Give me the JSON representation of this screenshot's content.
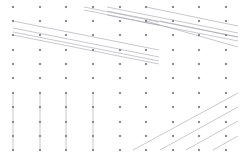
{
  "canvas": {
    "width": 241,
    "height": 160,
    "background": "#ffffff"
  },
  "style": {
    "point_color": "#8c8c99",
    "point_size": 2.1,
    "line_color": "#9b9bab",
    "line_width": 0.55
  },
  "chart_data": {
    "type": "scatter",
    "title": "",
    "subtitle": "",
    "xlabel": "",
    "ylabel": "",
    "grid": false,
    "legend": "none",
    "axis_visible": false,
    "tick_labels_x": [],
    "tick_labels_y": [],
    "xlim": [
      0,
      10
    ],
    "ylim": [
      0,
      10
    ],
    "grid_columns_px": [
      13,
      40,
      66,
      93,
      120,
      146,
      173,
      199,
      226,
      238
    ],
    "grid_rows_px": [
      7,
      21,
      35,
      50,
      64,
      78,
      93,
      107,
      122,
      136,
      150
    ],
    "points": [
      {
        "x": 13,
        "y": 7
      },
      {
        "x": 40,
        "y": 7
      },
      {
        "x": 66,
        "y": 7
      },
      {
        "x": 93,
        "y": 7
      },
      {
        "x": 120,
        "y": 7
      },
      {
        "x": 146,
        "y": 7
      },
      {
        "x": 173,
        "y": 7
      },
      {
        "x": 199,
        "y": 7
      },
      {
        "x": 226,
        "y": 7
      },
      {
        "x": 13,
        "y": 21
      },
      {
        "x": 40,
        "y": 21
      },
      {
        "x": 66,
        "y": 21
      },
      {
        "x": 93,
        "y": 21
      },
      {
        "x": 120,
        "y": 21
      },
      {
        "x": 146,
        "y": 21
      },
      {
        "x": 173,
        "y": 21
      },
      {
        "x": 199,
        "y": 21
      },
      {
        "x": 226,
        "y": 21
      },
      {
        "x": 13,
        "y": 35
      },
      {
        "x": 40,
        "y": 35
      },
      {
        "x": 66,
        "y": 35
      },
      {
        "x": 93,
        "y": 35
      },
      {
        "x": 120,
        "y": 35
      },
      {
        "x": 146,
        "y": 35
      },
      {
        "x": 173,
        "y": 35
      },
      {
        "x": 199,
        "y": 35
      },
      {
        "x": 226,
        "y": 35
      },
      {
        "x": 13,
        "y": 50
      },
      {
        "x": 40,
        "y": 50
      },
      {
        "x": 66,
        "y": 50
      },
      {
        "x": 93,
        "y": 50
      },
      {
        "x": 120,
        "y": 50
      },
      {
        "x": 146,
        "y": 50
      },
      {
        "x": 173,
        "y": 50
      },
      {
        "x": 199,
        "y": 50
      },
      {
        "x": 226,
        "y": 50
      },
      {
        "x": 13,
        "y": 64
      },
      {
        "x": 40,
        "y": 64
      },
      {
        "x": 66,
        "y": 64
      },
      {
        "x": 93,
        "y": 64
      },
      {
        "x": 120,
        "y": 64
      },
      {
        "x": 146,
        "y": 64
      },
      {
        "x": 173,
        "y": 64
      },
      {
        "x": 199,
        "y": 64
      },
      {
        "x": 226,
        "y": 64
      },
      {
        "x": 13,
        "y": 78
      },
      {
        "x": 40,
        "y": 78
      },
      {
        "x": 66,
        "y": 78
      },
      {
        "x": 93,
        "y": 78
      },
      {
        "x": 120,
        "y": 78
      },
      {
        "x": 146,
        "y": 78
      },
      {
        "x": 173,
        "y": 78
      },
      {
        "x": 199,
        "y": 78
      },
      {
        "x": 226,
        "y": 78
      },
      {
        "x": 13,
        "y": 93
      },
      {
        "x": 40,
        "y": 93
      },
      {
        "x": 66,
        "y": 93
      },
      {
        "x": 93,
        "y": 93
      },
      {
        "x": 120,
        "y": 93
      },
      {
        "x": 146,
        "y": 93
      },
      {
        "x": 173,
        "y": 93
      },
      {
        "x": 199,
        "y": 93
      },
      {
        "x": 226,
        "y": 93
      },
      {
        "x": 13,
        "y": 107
      },
      {
        "x": 40,
        "y": 107
      },
      {
        "x": 66,
        "y": 107
      },
      {
        "x": 93,
        "y": 107
      },
      {
        "x": 120,
        "y": 107
      },
      {
        "x": 146,
        "y": 107
      },
      {
        "x": 173,
        "y": 107
      },
      {
        "x": 199,
        "y": 107
      },
      {
        "x": 226,
        "y": 107
      },
      {
        "x": 13,
        "y": 122
      },
      {
        "x": 40,
        "y": 122
      },
      {
        "x": 66,
        "y": 122
      },
      {
        "x": 93,
        "y": 122
      },
      {
        "x": 120,
        "y": 122
      },
      {
        "x": 146,
        "y": 122
      },
      {
        "x": 173,
        "y": 122
      },
      {
        "x": 199,
        "y": 122
      },
      {
        "x": 226,
        "y": 122
      },
      {
        "x": 13,
        "y": 136
      },
      {
        "x": 40,
        "y": 136
      },
      {
        "x": 66,
        "y": 136
      },
      {
        "x": 93,
        "y": 136
      },
      {
        "x": 120,
        "y": 136
      },
      {
        "x": 146,
        "y": 136
      },
      {
        "x": 173,
        "y": 136
      },
      {
        "x": 199,
        "y": 136
      },
      {
        "x": 226,
        "y": 136
      },
      {
        "x": 13,
        "y": 150
      },
      {
        "x": 40,
        "y": 150
      },
      {
        "x": 66,
        "y": 150
      },
      {
        "x": 93,
        "y": 150
      },
      {
        "x": 120,
        "y": 150
      },
      {
        "x": 146,
        "y": 150
      },
      {
        "x": 173,
        "y": 150
      },
      {
        "x": 199,
        "y": 150
      },
      {
        "x": 226,
        "y": 150
      }
    ],
    "lines": [
      {
        "group": "upper-left-fan",
        "points": [
          [
            13,
            21
          ],
          [
            159,
            50
          ]
        ]
      },
      {
        "group": "upper-left-fan",
        "points": [
          [
            13,
            28
          ],
          [
            159,
            57
          ]
        ]
      },
      {
        "group": "upper-left-fan",
        "points": [
          [
            13,
            32
          ],
          [
            159,
            61
          ]
        ]
      },
      {
        "group": "upper-left-fan",
        "points": [
          [
            13,
            35
          ],
          [
            159,
            64
          ]
        ]
      },
      {
        "group": "upper-mid-fan",
        "points": [
          [
            84,
            7
          ],
          [
            159,
            22
          ]
        ]
      },
      {
        "group": "upper-mid-fan",
        "points": [
          [
            84,
            10
          ],
          [
            159,
            25
          ]
        ]
      },
      {
        "group": "upper-right-fan",
        "points": [
          [
            107,
            7
          ],
          [
            238,
            33
          ]
        ]
      },
      {
        "group": "upper-right-fan",
        "points": [
          [
            107,
            11
          ],
          [
            238,
            37
          ]
        ]
      },
      {
        "group": "upper-right-fan",
        "points": [
          [
            107,
            15
          ],
          [
            238,
            41
          ]
        ]
      },
      {
        "group": "upper-right-fan",
        "points": [
          [
            146,
            7
          ],
          [
            238,
            26
          ]
        ]
      },
      {
        "group": "upper-right-fan",
        "points": [
          [
            146,
            21
          ],
          [
            238,
            47
          ]
        ]
      },
      {
        "group": "upper-right-fan",
        "points": [
          [
            160,
            21
          ],
          [
            238,
            37
          ]
        ]
      },
      {
        "group": "lower-left-verticals",
        "points": [
          [
            13,
            93
          ],
          [
            13,
            150
          ]
        ]
      },
      {
        "group": "lower-left-verticals",
        "points": [
          [
            40,
            93
          ],
          [
            40,
            150
          ]
        ]
      },
      {
        "group": "lower-left-verticals",
        "points": [
          [
            66,
            93
          ],
          [
            66,
            150
          ]
        ]
      },
      {
        "group": "lower-left-verticals",
        "points": [
          [
            93,
            93
          ],
          [
            93,
            150
          ]
        ]
      },
      {
        "group": "lower-right-fan",
        "points": [
          [
            133,
            150
          ],
          [
            238,
            93
          ]
        ]
      },
      {
        "group": "lower-right-fan",
        "points": [
          [
            160,
            150
          ],
          [
            238,
            107
          ]
        ]
      },
      {
        "group": "lower-right-fan",
        "points": [
          [
            186,
            150
          ],
          [
            238,
            121
          ]
        ]
      },
      {
        "group": "lower-right-fan",
        "points": [
          [
            213,
            150
          ],
          [
            238,
            136
          ]
        ]
      }
    ]
  }
}
